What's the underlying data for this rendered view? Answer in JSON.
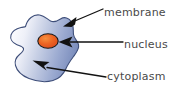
{
  "diagram": {
    "background_color": "#ffffff",
    "cell": {
      "name": "cell-body",
      "fill_light": "#f2f3fa",
      "fill_mid": "#aebbdb",
      "fill_dark": "#7487b8",
      "outline_color": "#3f4f7a",
      "outline_width": 1
    },
    "nucleus": {
      "name": "nucleus-shape",
      "fill": "#e8581f",
      "fill_highlight": "#f07a36",
      "outline_color": "#1c1c1c",
      "cx": 48,
      "cy": 41,
      "rx": 10,
      "ry": 7
    },
    "arrow_color": "#121212",
    "text_color": "#4a4a4a",
    "labels": [
      {
        "id": "membrane",
        "text": "membrane",
        "name": "label-membrane",
        "points_to": "cell outline",
        "arrow_tip": [
          63,
          26
        ],
        "arrow_tail": [
          103,
          9
        ]
      },
      {
        "id": "nucleus",
        "text": "nucleus",
        "name": "label-nucleus",
        "points_to": "nucleus",
        "arrow_tip": [
          59,
          42
        ],
        "arrow_tail": [
          123,
          42
        ]
      },
      {
        "id": "cytoplasm",
        "text": "cytoplasm",
        "name": "label-cytoplasm",
        "points_to": "cytoplasm region",
        "arrow_tip": [
          33,
          61
        ],
        "arrow_tail": [
          106,
          77
        ]
      }
    ]
  }
}
